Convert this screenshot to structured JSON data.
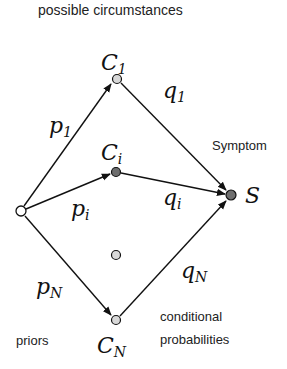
{
  "title": "possible circumstances",
  "labels": {
    "symptom": "Symptom",
    "priors": "priors",
    "conditional_line1": "conditional",
    "conditional_line2": "probabilities"
  },
  "nodes": {
    "source": {
      "x": 21,
      "y": 211,
      "fill": "#ffffff"
    },
    "c1": {
      "x": 117,
      "y": 79,
      "fill": "#d8d8d8",
      "label": "C",
      "sub": "1"
    },
    "ci": {
      "x": 116,
      "y": 172,
      "fill": "#6e6e6e",
      "label": "C",
      "sub": "i"
    },
    "mid": {
      "x": 116,
      "y": 255,
      "fill": "#d8d8d8"
    },
    "cn": {
      "x": 116,
      "y": 320,
      "fill": "#d8d8d8",
      "label": "C",
      "sub": "N"
    },
    "s": {
      "x": 231,
      "y": 195,
      "fill": "#6e6e6e",
      "label": "S"
    }
  },
  "edges": {
    "p1": {
      "label": "p",
      "sub": "1"
    },
    "pi": {
      "label": "p",
      "sub": "i"
    },
    "pn": {
      "label": "p",
      "sub": "N"
    },
    "q1": {
      "label": "q",
      "sub": "1"
    },
    "qi": {
      "label": "q",
      "sub": "i"
    },
    "qn": {
      "label": "q",
      "sub": "N"
    }
  }
}
